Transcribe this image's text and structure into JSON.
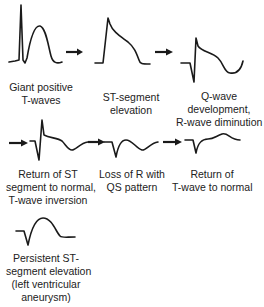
{
  "stages": [
    {
      "id": "giant-positive-t-waves",
      "lines": [
        "Giant positive",
        "T-waves"
      ]
    },
    {
      "id": "st-segment-elevation",
      "lines": [
        "ST-segment",
        "elevation"
      ]
    },
    {
      "id": "q-wave-development",
      "lines": [
        "Q-wave",
        "development,",
        "R-wave diminution"
      ]
    },
    {
      "id": "return-st-normal",
      "lines": [
        "Return of ST",
        "segment to normal,",
        "T-wave inversion"
      ]
    },
    {
      "id": "loss-of-r",
      "lines": [
        "Loss of R with",
        "QS pattern"
      ]
    },
    {
      "id": "return-t-normal",
      "lines": [
        "Return of",
        "T-wave to normal"
      ]
    },
    {
      "id": "persistent-st-elevation",
      "lines": [
        "Persistent ST-",
        "segment elevation",
        "(left ventricular",
        "aneurysm)"
      ]
    }
  ],
  "arrows": [
    {
      "from": "giant-positive-t-waves",
      "to": "st-segment-elevation"
    },
    {
      "from": "st-segment-elevation",
      "to": "q-wave-development"
    },
    {
      "from": "q-wave-development",
      "to": "return-st-normal"
    },
    {
      "from": "return-st-normal",
      "to": "loss-of-r"
    },
    {
      "from": "loss-of-r",
      "to": "return-t-normal"
    }
  ],
  "colors": {
    "stroke": "#1a1a1a",
    "text": "#222222",
    "background": "#ffffff"
  }
}
